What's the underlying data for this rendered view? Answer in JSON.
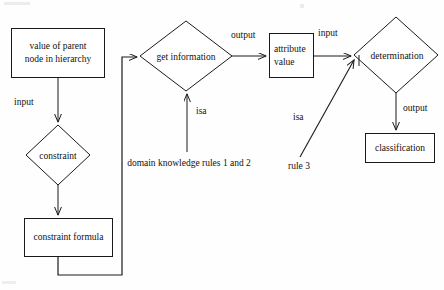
{
  "diagram": {
    "canvas": {
      "width": 444,
      "height": 290,
      "background": "#fefefe"
    },
    "stroke_color": "#1a1a1a",
    "text_color": "#111111",
    "nodes": [
      {
        "id": "value-of-parent-node",
        "shape": "box",
        "line1": "value of parent",
        "line2": "node in hierarchy",
        "x": 11,
        "y": 28,
        "w": 94,
        "h": 50,
        "font_size": 9.5
      },
      {
        "id": "constraint",
        "shape": "diamond",
        "label": "constraint",
        "cx": 58,
        "cy": 155,
        "rx": 32,
        "ry": 30,
        "font_size": 9.5
      },
      {
        "id": "constraint-formula",
        "shape": "box",
        "line1": "constraint formula",
        "x": 24,
        "y": 218,
        "w": 89,
        "h": 39,
        "font_size": 9.5
      },
      {
        "id": "get-information",
        "shape": "diamond",
        "label": "get information",
        "cx": 186,
        "cy": 56,
        "rx": 46,
        "ry": 35,
        "font_size": 9.5
      },
      {
        "id": "attribute-value",
        "shape": "box",
        "line1": "attribute",
        "line2": "value",
        "x": 269,
        "y": 33,
        "w": 45,
        "h": 45,
        "font_size": 9.5
      },
      {
        "id": "determination",
        "shape": "diamond",
        "label": "determination",
        "cx": 396,
        "cy": 55,
        "rx": 42,
        "ry": 38,
        "font_size": 9.5
      },
      {
        "id": "classification",
        "shape": "box",
        "line1": "classification",
        "x": 365,
        "y": 133,
        "w": 70,
        "h": 30,
        "font_size": 9.5
      }
    ],
    "edge_labels": [
      {
        "id": "input-constraint",
        "text": "input",
        "x": 14,
        "y": 97,
        "font_size": 9.5
      },
      {
        "id": "output-getinfo",
        "text": "output",
        "x": 231,
        "y": 30,
        "font_size": 9.5
      },
      {
        "id": "input-determination",
        "text": "input",
        "x": 318,
        "y": 28,
        "font_size": 9.5
      },
      {
        "id": "output-classification",
        "text": "output",
        "x": 403,
        "y": 103,
        "font_size": 9.5
      },
      {
        "id": "isa-domain-knowledge",
        "text": "isa",
        "x": 196,
        "y": 106,
        "font_size": 9.5
      },
      {
        "id": "isa-rule3",
        "text": "isa",
        "x": 293,
        "y": 112,
        "font_size": 9.5
      }
    ],
    "notes": [
      {
        "id": "domain-knowledge-note",
        "line1": "domain knowledge",
        "line2": "rules 1 and 2",
        "cx": 189,
        "y": 156,
        "font_size": 9.5
      },
      {
        "id": "rule3-note",
        "line1": "rule 3",
        "cx": 299,
        "y": 161,
        "font_size": 9.5
      }
    ],
    "connectors": [
      {
        "id": "parent-to-constraint",
        "from": "value-of-parent-node",
        "to": "constraint",
        "type": "arrow-down"
      },
      {
        "id": "constraint-to-formula",
        "from": "constraint",
        "to": "constraint-formula",
        "type": "arrow-down"
      },
      {
        "id": "formula-feedback-to-getinfo",
        "from": "constraint-formula",
        "to": "get-information",
        "type": "orthogonal-feedback-arrow"
      },
      {
        "id": "getinfo-to-attribute",
        "from": "get-information",
        "to": "attribute-value",
        "type": "arrow-right"
      },
      {
        "id": "attribute-to-determination",
        "from": "attribute-value",
        "to": "determination",
        "type": "arrow-right"
      },
      {
        "id": "determination-to-classification",
        "from": "determination",
        "to": "classification",
        "type": "arrow-down"
      },
      {
        "id": "domain-knowledge-to-getinfo",
        "from": "domain-knowledge-note",
        "to": "get-information",
        "type": "arrow-up"
      },
      {
        "id": "rule3-to-determination",
        "from": "rule3-note",
        "to": "determination",
        "type": "diagonal-arrow"
      }
    ]
  }
}
